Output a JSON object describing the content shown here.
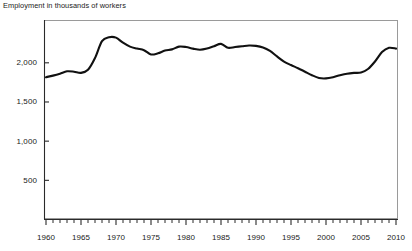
{
  "chart_data": {
    "type": "line",
    "title": "Employment in thousands of workers",
    "xlabel": "",
    "ylabel": "",
    "grid": false,
    "legend": false,
    "xlim": [
      1960,
      2010
    ],
    "ylim": [
      0,
      2540
    ],
    "y_ticks": [
      500,
      1000,
      1500,
      2000
    ],
    "y_tick_labels": [
      "500",
      "1,000",
      "1,500",
      "2,000"
    ],
    "x_ticks": [
      1960,
      1961,
      1962,
      1963,
      1964,
      1965,
      1966,
      1967,
      1968,
      1969,
      1970,
      1971,
      1972,
      1973,
      1974,
      1975,
      1976,
      1977,
      1978,
      1979,
      1980,
      1981,
      1982,
      1983,
      1984,
      1985,
      1986,
      1987,
      1988,
      1989,
      1990,
      1991,
      1992,
      1993,
      1994,
      1995,
      1996,
      1997,
      1998,
      1999,
      2000,
      2001,
      2002,
      2003,
      2004,
      2005,
      2006,
      2007,
      2008,
      2009,
      2010
    ],
    "x_tick_labels": [
      "1960",
      "1965",
      "1970",
      "1975",
      "1980",
      "1985",
      "1990",
      "1995",
      "2000",
      "2005",
      "2010"
    ],
    "x_tick_label_years": [
      1960,
      1965,
      1970,
      1975,
      1980,
      1985,
      1990,
      1995,
      2000,
      2005,
      2010
    ],
    "line_color": "#111111",
    "series": [
      {
        "name": "Employment",
        "x": [
          1960,
          1961,
          1962,
          1963,
          1964,
          1965,
          1966,
          1967,
          1968,
          1969,
          1970,
          1971,
          1972,
          1973,
          1974,
          1975,
          1976,
          1977,
          1978,
          1979,
          1980,
          1981,
          1982,
          1983,
          1984,
          1985,
          1986,
          1987,
          1988,
          1989,
          1990,
          1991,
          1992,
          1993,
          1994,
          1995,
          1996,
          1997,
          1998,
          1999,
          2000,
          2001,
          2002,
          2003,
          2004,
          2005,
          2006,
          2007,
          2008,
          2009,
          2010
        ],
        "values": [
          1810,
          1830,
          1855,
          1885,
          1880,
          1865,
          1905,
          2055,
          2270,
          2320,
          2315,
          2250,
          2200,
          2175,
          2155,
          2100,
          2115,
          2150,
          2165,
          2200,
          2195,
          2175,
          2160,
          2175,
          2205,
          2235,
          2185,
          2195,
          2205,
          2215,
          2210,
          2190,
          2145,
          2075,
          2010,
          1965,
          1925,
          1880,
          1835,
          1800,
          1795,
          1810,
          1835,
          1855,
          1865,
          1870,
          1915,
          2010,
          2130,
          2185,
          2175
        ]
      }
    ]
  },
  "layout": {
    "plot_left": 44,
    "plot_right": 398,
    "plot_top": 20,
    "plot_bottom": 219,
    "y_value_max": 2540,
    "x_axis_label_y": 240
  }
}
